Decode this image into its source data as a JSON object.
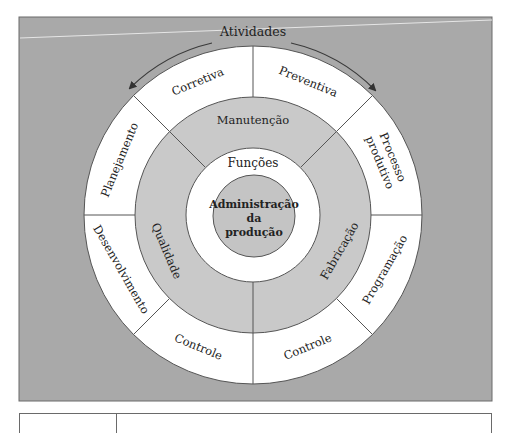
{
  "diagram": {
    "top_label": "Atividades",
    "center": {
      "lines": [
        "Administração",
        "da",
        "produção"
      ]
    },
    "inner_ring_label": "Funções",
    "middle_ring": [
      {
        "label": "Manutenção",
        "angle": 0
      },
      {
        "label": "Fabricação",
        "angle": 112.5
      },
      {
        "label": "Qualidade",
        "angle": 247.5
      }
    ],
    "outer_ring": [
      {
        "label": "Corretiva",
        "angle": 337.5
      },
      {
        "label": "Preventiva",
        "angle": 22.5
      },
      {
        "label": "Processo",
        "label2": "produtivo",
        "angle": 67.5
      },
      {
        "label": "Programação",
        "angle": 112.5
      },
      {
        "label": "Controle",
        "angle": 157.5
      },
      {
        "label": "Controle",
        "angle": 202.5
      },
      {
        "label": "Desenvolvimento",
        "angle": 247.5
      },
      {
        "label": "Planejamento",
        "angle": 292.5
      }
    ],
    "colors": {
      "background": "#a9a9a9",
      "outer_ring": "#ffffff",
      "middle_ring": "#c9c9c9",
      "inner_ring": "#ffffff",
      "center": "#c4c4c4",
      "stroke": "#555555",
      "arrow": "#444444"
    }
  }
}
